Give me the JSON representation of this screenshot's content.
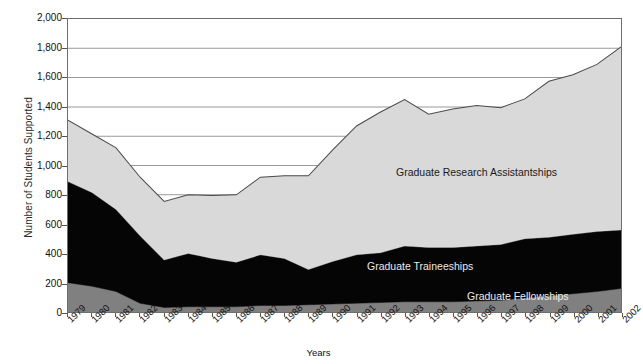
{
  "chart_data": {
    "type": "area",
    "stacked": true,
    "title": "",
    "xlabel": "Years",
    "ylabel": "Number of Students Supported",
    "ylim": [
      0,
      2000
    ],
    "ytick_step": 200,
    "ytick_labels": [
      "2,000",
      "1,800",
      "1,600",
      "1,400",
      "1,200",
      "1,000",
      "800",
      "600",
      "400",
      "200",
      "0"
    ],
    "grid": true,
    "grid_axis": "y",
    "legend_position": "in-plot-annotations",
    "categories": [
      "1979",
      "1980",
      "1981",
      "1982",
      "1983",
      "1984",
      "1985",
      "1986",
      "1987",
      "1988",
      "1989",
      "1990",
      "1991",
      "1992",
      "1993",
      "1994",
      "1995",
      "1996",
      "1997",
      "1998",
      "1999",
      "2000",
      "2001",
      "2002"
    ],
    "series": [
      {
        "name": "Graduate Fellowships",
        "color": "#808080",
        "stack_order": 1,
        "values": [
          200,
          175,
          140,
          60,
          30,
          35,
          35,
          35,
          45,
          45,
          50,
          55,
          60,
          65,
          70,
          70,
          70,
          75,
          80,
          95,
          110,
          125,
          140,
          160
        ]
      },
      {
        "name": "Graduate Traineeships",
        "color": "#050505",
        "stack_order": 2,
        "values": [
          690,
          640,
          560,
          460,
          325,
          365,
          330,
          305,
          345,
          320,
          240,
          290,
          330,
          340,
          380,
          370,
          370,
          375,
          380,
          405,
          400,
          405,
          410,
          400
        ]
      },
      {
        "name": "Graduate Research Assistantships",
        "color": "#d9d9d9",
        "stack_order": 3,
        "values": [
          420,
          400,
          420,
          400,
          400,
          400,
          430,
          460,
          530,
          565,
          640,
          760,
          880,
          960,
          1000,
          910,
          945,
          960,
          935,
          955,
          1065,
          1090,
          1140,
          1250
        ]
      }
    ],
    "cumulative_totals": [
      1310,
      1215,
      1120,
      920,
      755,
      800,
      795,
      795,
      920,
      930,
      930,
      1105,
      1270,
      1365,
      1450,
      1350,
      1385,
      1410,
      1395,
      1455,
      1575,
      1620,
      1690,
      1810
    ]
  },
  "annotations": {
    "graduate_research_assistantships": "Graduate Research Assistantships",
    "graduate_traineeships": "Graduate Traineeships",
    "graduate_fellowships": "Graduate Fellowships"
  }
}
